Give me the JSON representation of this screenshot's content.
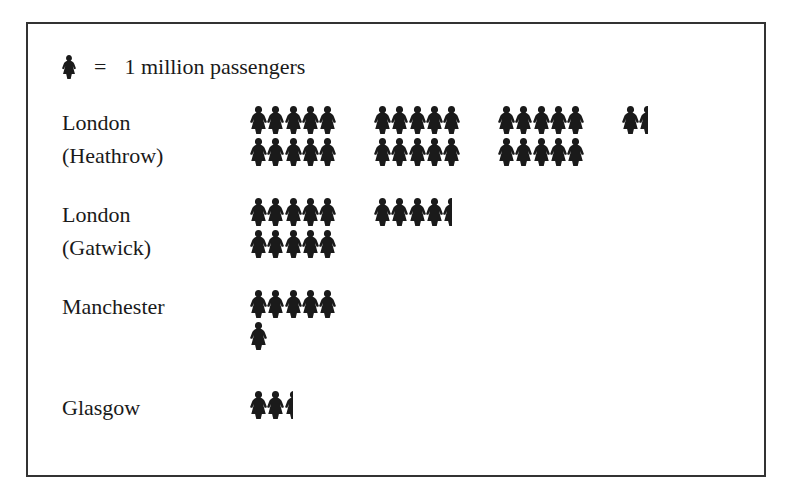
{
  "legend": {
    "symbol": "person-icon",
    "equals": "=",
    "text": "1 million passengers",
    "unit_value": 1
  },
  "airports": [
    {
      "name_line1": "London",
      "name_line2": "(Heathrow)",
      "passengers_millions": 31.5
    },
    {
      "name_line1": "London",
      "name_line2": "(Gatwick)",
      "passengers_millions": 14.5
    },
    {
      "name_line1": "Manchester",
      "name_line2": "",
      "passengers_millions": 6
    },
    {
      "name_line1": "Glasgow",
      "name_line2": "",
      "passengers_millions": 2.5
    }
  ],
  "colors": {
    "icon": "#1a1a1a",
    "border": "#333333",
    "background": "#ffffff"
  },
  "chart_data": {
    "type": "pictogram",
    "title": "",
    "legend": "1 icon = 1 million passengers",
    "categories": [
      "London (Heathrow)",
      "London (Gatwick)",
      "Manchester",
      "Glasgow"
    ],
    "values": [
      31.5,
      14.5,
      6,
      2.5
    ],
    "unit": "million passengers",
    "xlabel": "",
    "ylabel": "",
    "grid": false
  }
}
